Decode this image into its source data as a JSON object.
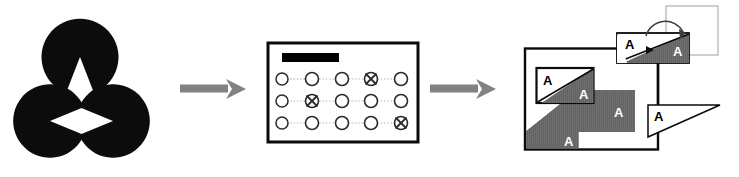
{
  "figure": {
    "background_color": "#ffffff",
    "width": 739,
    "height": 177
  },
  "colors": {
    "black": "#000000",
    "arrow_gray": "#808080",
    "hatch_gray": "#6e6e6e",
    "outline_light_gray": "#b5b5b5",
    "white": "#ffffff"
  },
  "stage1": {
    "name": "kanizsa-triangle",
    "description": "Three black pac-man disks forming an illusory triangle",
    "shapes": [
      {
        "id": "pacman-top",
        "cx": 80,
        "cy": 57,
        "r": 31,
        "wedge_direction": "down"
      },
      {
        "id": "pacman-bottom-left",
        "cx": 50,
        "cy": 121,
        "r": 31,
        "wedge_direction": "up-right"
      },
      {
        "id": "pacman-bottom-right",
        "cx": 113,
        "cy": 121,
        "r": 31,
        "wedge_direction": "up-left"
      }
    ]
  },
  "arrows": [
    {
      "id": "arrow-1",
      "x": 182,
      "y": 86,
      "length": 62,
      "label": ""
    },
    {
      "id": "arrow-2",
      "x": 432,
      "y": 86,
      "length": 62,
      "label": ""
    }
  ],
  "stage2": {
    "name": "visual-search-display",
    "border_color": "#000000",
    "banner": {
      "id": "top-bar",
      "color": "#000000"
    },
    "grid": {
      "rows": 3,
      "columns": 5,
      "marker_unmarked": "circle",
      "marker_marked": "circle-with-x",
      "connector": "dotted-line",
      "cells": [
        [
          "circle",
          "circle",
          "circle",
          "circle-x",
          "circle"
        ],
        [
          "circle",
          "circle-x",
          "circle",
          "circle",
          "circle"
        ],
        [
          "circle",
          "circle",
          "circle",
          "circle",
          "circle-x"
        ]
      ],
      "marked_positions": [
        {
          "row": 1,
          "col": 4
        },
        {
          "row": 2,
          "col": 2
        },
        {
          "row": 3,
          "col": 5
        }
      ]
    }
  },
  "stage3": {
    "name": "letter-a-shape-composition",
    "letter": "A",
    "ghost_square": {
      "id": "ghost-square-outline",
      "stroke": "#b5b5b5"
    },
    "rotation_arrow": {
      "id": "rotation-arrow",
      "direction": "clockwise"
    },
    "parts": [
      {
        "id": "main-rectangle",
        "fill": "white",
        "stroke": "#000000",
        "letter": "A",
        "diagonal": "bottom-left-wedge"
      },
      {
        "id": "inner-rectangle",
        "fill": "white",
        "stroke": "#000000",
        "letters": [
          "A",
          "A"
        ],
        "diagonal": "split"
      },
      {
        "id": "gray-rectangle",
        "fill": "#6e6e6e",
        "letter": "A"
      },
      {
        "id": "top-rectangle",
        "fill": "split-white-gray",
        "stroke": "#000000",
        "letters": [
          "A",
          "A"
        ]
      },
      {
        "id": "right-triangle",
        "fill": "white",
        "stroke": "#000000",
        "letter": "A"
      }
    ],
    "letter_instances": [
      {
        "id": "a-top-white",
        "letter": "A",
        "color": "#000000"
      },
      {
        "id": "a-top-gray",
        "letter": "A",
        "color": "#ffffff"
      },
      {
        "id": "a-inner-white",
        "letter": "A",
        "color": "#000000"
      },
      {
        "id": "a-inner-gray",
        "letter": "A",
        "color": "#ffffff"
      },
      {
        "id": "a-gray-rect",
        "letter": "A",
        "color": "#ffffff"
      },
      {
        "id": "a-main-wedge",
        "letter": "A",
        "color": "#ffffff"
      },
      {
        "id": "a-right-triangle",
        "letter": "A",
        "color": "#000000"
      }
    ]
  }
}
